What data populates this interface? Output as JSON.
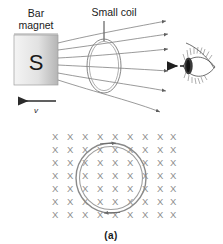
{
  "figure": {
    "caption": "(a)",
    "labels": {
      "bar_magnet_line1": "Bar",
      "bar_magnet_line2": "magnet",
      "small_coil": "Small coil",
      "south_pole": "S",
      "velocity": "v"
    },
    "field_symbol": "X",
    "colors": {
      "ink": "#1a1a1a",
      "field_line": "#6e6e6e",
      "x_symbol": "#8d8d8d",
      "magnet_light": "#f2f2f2",
      "magnet_dark": "#b9b9b9",
      "coil": "#7a7a7a",
      "background": "#ffffff"
    },
    "field_lines_count": 6,
    "x_grid": {
      "columns": 9,
      "rows": 7
    },
    "arrows": {
      "velocity_direction": "left",
      "viewing_direction": "left",
      "field_direction": "right"
    }
  }
}
